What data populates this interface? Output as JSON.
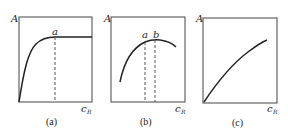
{
  "panels": [
    {
      "id": "a",
      "caption": "(a)",
      "y_label": "A",
      "x_label_main": "c",
      "x_label_sub": "R",
      "markers": [
        "a"
      ],
      "description": "A rises steeply from origin then levels off to a plateau at point a"
    },
    {
      "id": "b",
      "caption": "(b)",
      "y_label": "A",
      "x_label_main": "c",
      "x_label_sub": "R",
      "markers": [
        "a",
        "b"
      ],
      "description": "A rises to a broad maximum between a and b then declines slightly"
    },
    {
      "id": "c",
      "caption": "(c)",
      "y_label": "A",
      "x_label_main": "c",
      "x_label_sub": "R",
      "markers": [],
      "description": "A increases monotonically and nearly linearly with cR"
    }
  ]
}
